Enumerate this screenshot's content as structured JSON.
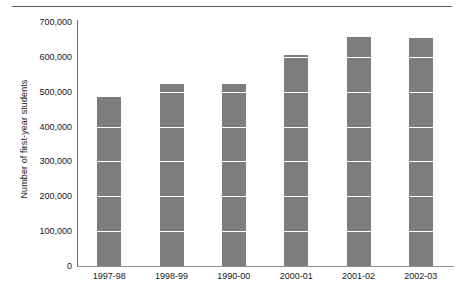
{
  "chart_data": {
    "type": "bar",
    "title": "",
    "xlabel": "",
    "ylabel": "Number of first-year students",
    "categories": [
      "1997-98",
      "1998-99",
      "1990-00",
      "2000-01",
      "2001-02",
      "2002-03"
    ],
    "values": [
      485000,
      522000,
      521000,
      604000,
      657000,
      655000
    ],
    "ylim": [
      0,
      700000
    ],
    "ytick_values": [
      0,
      100000,
      200000,
      300000,
      400000,
      500000,
      600000,
      700000
    ],
    "ytick_labels": [
      "0",
      "100,000",
      "200,000",
      "300,000",
      "400,000",
      "500,000",
      "600,000",
      "700,000"
    ],
    "grid": true,
    "grid_color": "#ffffff",
    "legend": null,
    "bar_color": "#7d7d7d",
    "axis_color": "#6a6a6a",
    "series": [
      {
        "name": "Number of first-year students",
        "values": [
          485000,
          522000,
          521000,
          604000,
          657000,
          655000
        ]
      }
    ]
  }
}
